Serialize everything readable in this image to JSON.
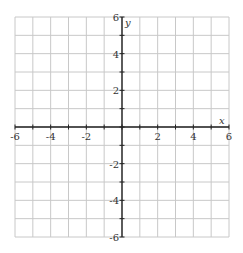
{
  "chart_data": {
    "type": "scatter",
    "title": "",
    "xlabel": "x",
    "ylabel": "y",
    "xlim": [
      -6,
      6
    ],
    "ylim": [
      -6,
      6
    ],
    "grid": true,
    "grid_step": 1,
    "x_ticks": [
      -6,
      -5,
      -4,
      -3,
      -2,
      -1,
      0,
      1,
      2,
      3,
      4,
      5,
      6
    ],
    "y_ticks": [
      -6,
      -5,
      -4,
      -3,
      -2,
      -1,
      0,
      1,
      2,
      3,
      4,
      5,
      6
    ],
    "x_tick_labels": [
      {
        "value": -6,
        "text": "-6"
      },
      {
        "value": -4,
        "text": "-4"
      },
      {
        "value": -2,
        "text": "-2"
      },
      {
        "value": 2,
        "text": "2"
      },
      {
        "value": 4,
        "text": "4"
      },
      {
        "value": 6,
        "text": "6"
      }
    ],
    "y_tick_labels": [
      {
        "value": 6,
        "text": "6"
      },
      {
        "value": 4,
        "text": "4"
      },
      {
        "value": 2,
        "text": "2"
      },
      {
        "value": -2,
        "text": "-2"
      },
      {
        "value": -4,
        "text": "-4"
      },
      {
        "value": -6,
        "text": "-6"
      }
    ],
    "series": [],
    "legend": null
  },
  "colors": {
    "grid": "#c8c8c8",
    "axis": "#222222",
    "text": "#333333",
    "background": "#ffffff"
  }
}
